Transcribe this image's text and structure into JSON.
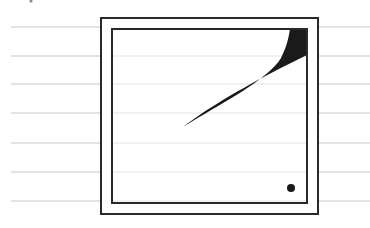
{
  "figure": {
    "colors": {
      "background": "#ffffff",
      "ruled_line": "#c8c8c8",
      "ruled_line_inner": "#e2e2e2",
      "frame": "#2a2a2a",
      "shape_fill": "#1a1a1a"
    },
    "ruled_lines_y": [
      27,
      56,
      84,
      113,
      143,
      172,
      201
    ],
    "ruled_lines_x_start": 11,
    "outer_frame": {
      "x": 101,
      "y": 18,
      "width": 217,
      "height": 196
    },
    "inner_frame": {
      "x": 112,
      "y": 29,
      "width": 195,
      "height": 174
    },
    "wedge": {
      "tip": [
        183,
        127
      ],
      "corner": [
        307,
        29
      ]
    },
    "dot": {
      "cx": 291,
      "cy": 188,
      "r": 4
    }
  }
}
